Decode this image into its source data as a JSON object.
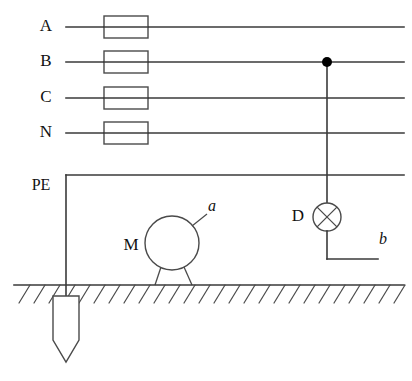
{
  "diagram": {
    "background_color": "#ffffff",
    "line_color": "#3a3a3a",
    "junction_color": "#000000",
    "conductors": [
      {
        "id": "A",
        "label": "A",
        "y": 27,
        "has_fuse": true,
        "x_start": 66,
        "x_end": 404
      },
      {
        "id": "B",
        "label": "B",
        "y": 62,
        "has_fuse": true,
        "x_start": 66,
        "x_end": 404
      },
      {
        "id": "C",
        "label": "C",
        "y": 98,
        "has_fuse": true,
        "x_start": 66,
        "x_end": 404
      },
      {
        "id": "N",
        "label": "N",
        "y": 133,
        "has_fuse": true,
        "x_start": 66,
        "x_end": 404
      },
      {
        "id": "PE",
        "label": "PE",
        "y": 175,
        "has_fuse": false,
        "x_start": 66,
        "x_end": 404
      }
    ],
    "fuse": {
      "x": 104,
      "width": 44,
      "height": 22,
      "fill": "#ffffff"
    },
    "junction": {
      "label": "",
      "x": 327,
      "y": 62,
      "radius": 5
    },
    "lamp": {
      "label": "D",
      "label_x": 298,
      "label_y": 217,
      "cx": 327,
      "cy": 217,
      "r": 14,
      "symbol": "circle-with-x",
      "lead_bottom_y": 259,
      "lead_right_x": 378
    },
    "lamp_terminal": {
      "label": "b",
      "x": 383,
      "y": 240
    },
    "motor": {
      "label": "M",
      "label_x": 131,
      "label_y": 246,
      "cx": 172,
      "cy": 243,
      "r": 27,
      "leg_left_x": 155,
      "leg_right_x": 192,
      "leg_bottom_y": 285
    },
    "motor_terminal": {
      "label": "a",
      "x": 211,
      "y": 208,
      "leader_from_x": 192,
      "leader_from_y": 226,
      "leader_to_x": 207,
      "leader_to_y": 216
    },
    "ground": {
      "y": 285,
      "x_start": 14,
      "x_end": 404,
      "hatch_count": 26,
      "hatch_dx": -11,
      "hatch_dy": 18
    },
    "pe_drop": {
      "x": 66,
      "from_y": 175,
      "to_y": 296
    },
    "earth_electrode": {
      "x": 66,
      "top_y": 296,
      "width": 26,
      "body_bottom_y": 340,
      "tip_y": 362
    }
  }
}
